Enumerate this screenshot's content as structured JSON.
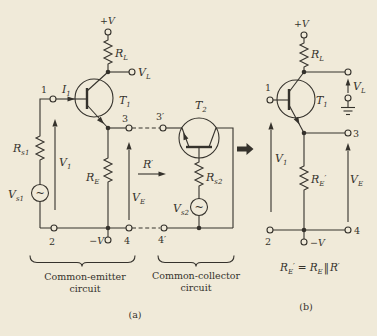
{
  "colors": {
    "background": "#f0ead9",
    "ink": "#35322c"
  },
  "supplies": {
    "plus_v": "+V",
    "minus_v": "−V"
  },
  "source_symbol": "~",
  "components": {
    "rl": {
      "base": "R",
      "sub": "L"
    },
    "rs1": {
      "base": "R",
      "sub": "s1"
    },
    "rs2": {
      "base": "R",
      "sub": "s2"
    },
    "re": {
      "base": "R",
      "sub": "E"
    },
    "re_prime": {
      "base": "R",
      "sub": "E",
      "prime": "′"
    },
    "r_prime": {
      "base": "R",
      "prime": "′"
    },
    "t1": {
      "base": "T",
      "sub": "1"
    },
    "t2": {
      "base": "T",
      "sub": "2"
    },
    "vs1": {
      "base": "V",
      "sub": "s1"
    },
    "vs2": {
      "base": "V",
      "sub": "s2"
    },
    "v1": {
      "base": "V",
      "sub": "1"
    },
    "ve": {
      "base": "V",
      "sub": "E"
    },
    "vl": {
      "base": "V",
      "sub": "L"
    },
    "i1": {
      "base": "I",
      "sub": "1"
    }
  },
  "nodes": {
    "n1": "1",
    "n2": "2",
    "n3": "3",
    "n3_prime": "3′",
    "n4": "4",
    "n4_prime": "4′"
  },
  "captions": {
    "common_emitter": {
      "line1": "Common-emitter",
      "line2": "circuit"
    },
    "common_collector": {
      "line1": "Common-collector",
      "line2": "circuit"
    },
    "sub_a": "(a)",
    "sub_b": "(b)"
  },
  "equation": {
    "lhs": {
      "base": "R",
      "sub": "E",
      "prime": "′"
    },
    "equals": "=",
    "rhs1": {
      "base": "R",
      "sub": "E"
    },
    "parallel": "‖",
    "rhs2": {
      "base": "R",
      "prime": "′"
    }
  }
}
